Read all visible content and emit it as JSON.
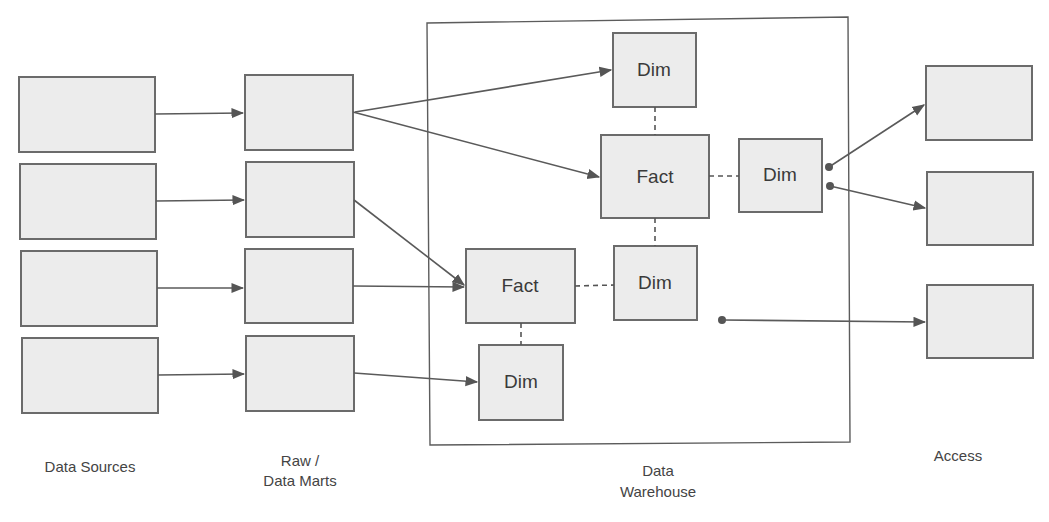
{
  "diagram": {
    "columns": {
      "sources": {
        "label": "Data Sources"
      },
      "raw": {
        "label_line1": "Raw /",
        "label_line2": "Data Marts"
      },
      "warehouse": {
        "label_line1": "Data",
        "label_line2": "Warehouse"
      },
      "access": {
        "label": "Access"
      }
    },
    "nodes": {
      "dim_top": "Dim",
      "fact_main": "Fact",
      "dim_right": "Dim",
      "fact_secondary": "Fact",
      "dim_middle": "Dim",
      "dim_bottom": "Dim"
    },
    "source_boxes": 4,
    "raw_boxes": 4,
    "access_boxes": 3,
    "colors": {
      "box_fill": "#ececec",
      "box_stroke": "#6b6b6b",
      "line": "#5a5a5a"
    }
  }
}
